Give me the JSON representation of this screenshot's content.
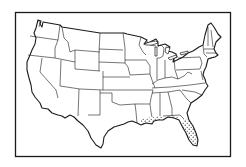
{
  "map": {
    "subject": "Contiguous United States outline map with state boundaries",
    "style": "black line drawing on white",
    "colors": {
      "line": "#1a1a1a",
      "background": "#ffffff",
      "stipple": "#1a1a1a"
    },
    "highlighted_region": {
      "pattern": "stipple-dots",
      "areas": [
        "southern Louisiana coast",
        "Mississippi coast",
        "Alabama coast",
        "Florida panhandle coast",
        "peninsular Florida"
      ]
    },
    "frame": {
      "x": 15,
      "y": 12,
      "width": 216,
      "height": 145
    }
  }
}
